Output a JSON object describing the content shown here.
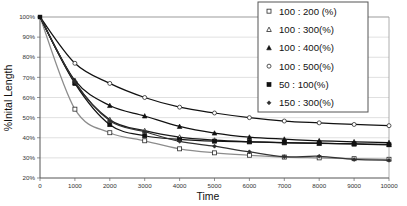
{
  "chart_data": {
    "type": "line",
    "title": "",
    "xlabel": "Time",
    "ylabel": "%Inital Length",
    "xlim": [
      0,
      10000
    ],
    "ylim": [
      20,
      100
    ],
    "xticks": [
      0,
      1000,
      2000,
      3000,
      4000,
      5000,
      6000,
      7000,
      8000,
      9000,
      10000
    ],
    "xtick_labels": [
      "0",
      "1000",
      "2000",
      "3000",
      "4000",
      "5000",
      "6000",
      "7000",
      "8000",
      "9000",
      "10000"
    ],
    "yticks": [
      20,
      30,
      40,
      50,
      60,
      70,
      80,
      90,
      100
    ],
    "ytick_labels": [
      "20%",
      "30%",
      "40%",
      "50%",
      "60%",
      "70%",
      "80%",
      "90%",
      "100%"
    ],
    "grid": "horizontal",
    "legend_position": "top-right",
    "x": [
      0,
      1000,
      2000,
      3000,
      4000,
      5000,
      6000,
      7000,
      8000,
      9000,
      10000
    ],
    "series": [
      {
        "name": "100 : 200 (%)",
        "marker": "open-square",
        "color": "#8c8c8c",
        "values": [
          100,
          54.2,
          42.5,
          38.5,
          34.5,
          32.5,
          31.3,
          30.4,
          30.0,
          29.6,
          29.3
        ]
      },
      {
        "name": "100 : 300(%)",
        "marker": "open-triangle",
        "color": "#1a1a1a",
        "values": [
          100,
          67.5,
          49.0,
          43.5,
          40.3,
          38.8,
          38.0,
          37.5,
          37.2,
          36.9,
          36.7
        ]
      },
      {
        "name": "100 : 400(%)",
        "marker": "filled-triangle",
        "color": "#111111",
        "values": [
          100,
          68.5,
          56.0,
          50.8,
          45.6,
          42.3,
          40.3,
          39.3,
          38.5,
          38.0,
          37.6
        ]
      },
      {
        "name": "100 : 500(%)",
        "marker": "open-circle",
        "color": "#111111",
        "values": [
          100,
          77.0,
          67.0,
          60.0,
          55.2,
          52.3,
          50.0,
          48.3,
          47.4,
          46.6,
          46.0
        ]
      },
      {
        "name": "50 : 100(%)",
        "marker": "filled-square",
        "color": "#141414",
        "values": [
          100,
          67.0,
          46.5,
          41.0,
          39.2,
          38.3,
          38.0,
          37.6,
          37.3,
          36.9,
          36.5
        ]
      },
      {
        "name": "150 : 300(%)",
        "marker": "filled-diamond",
        "color": "#333333",
        "values": [
          100,
          67.8,
          48.5,
          43.0,
          38.2,
          35.8,
          33.0,
          30.6,
          30.8,
          29.2,
          28.8
        ]
      }
    ]
  },
  "legend": {
    "items": [
      {
        "label": "100 : 200 (%)",
        "marker": "open-square"
      },
      {
        "label": "100 : 300(%)",
        "marker": "open-triangle"
      },
      {
        "label": "100 : 400(%)",
        "marker": "filled-triangle"
      },
      {
        "label": "100 : 500(%)",
        "marker": "open-circle"
      },
      {
        "label": "50 : 100(%)",
        "marker": "filled-square"
      },
      {
        "label": "150 : 300(%)",
        "marker": "filled-diamond"
      }
    ]
  },
  "axes": {
    "x_title": "Time",
    "y_title": "%Inital Length"
  }
}
